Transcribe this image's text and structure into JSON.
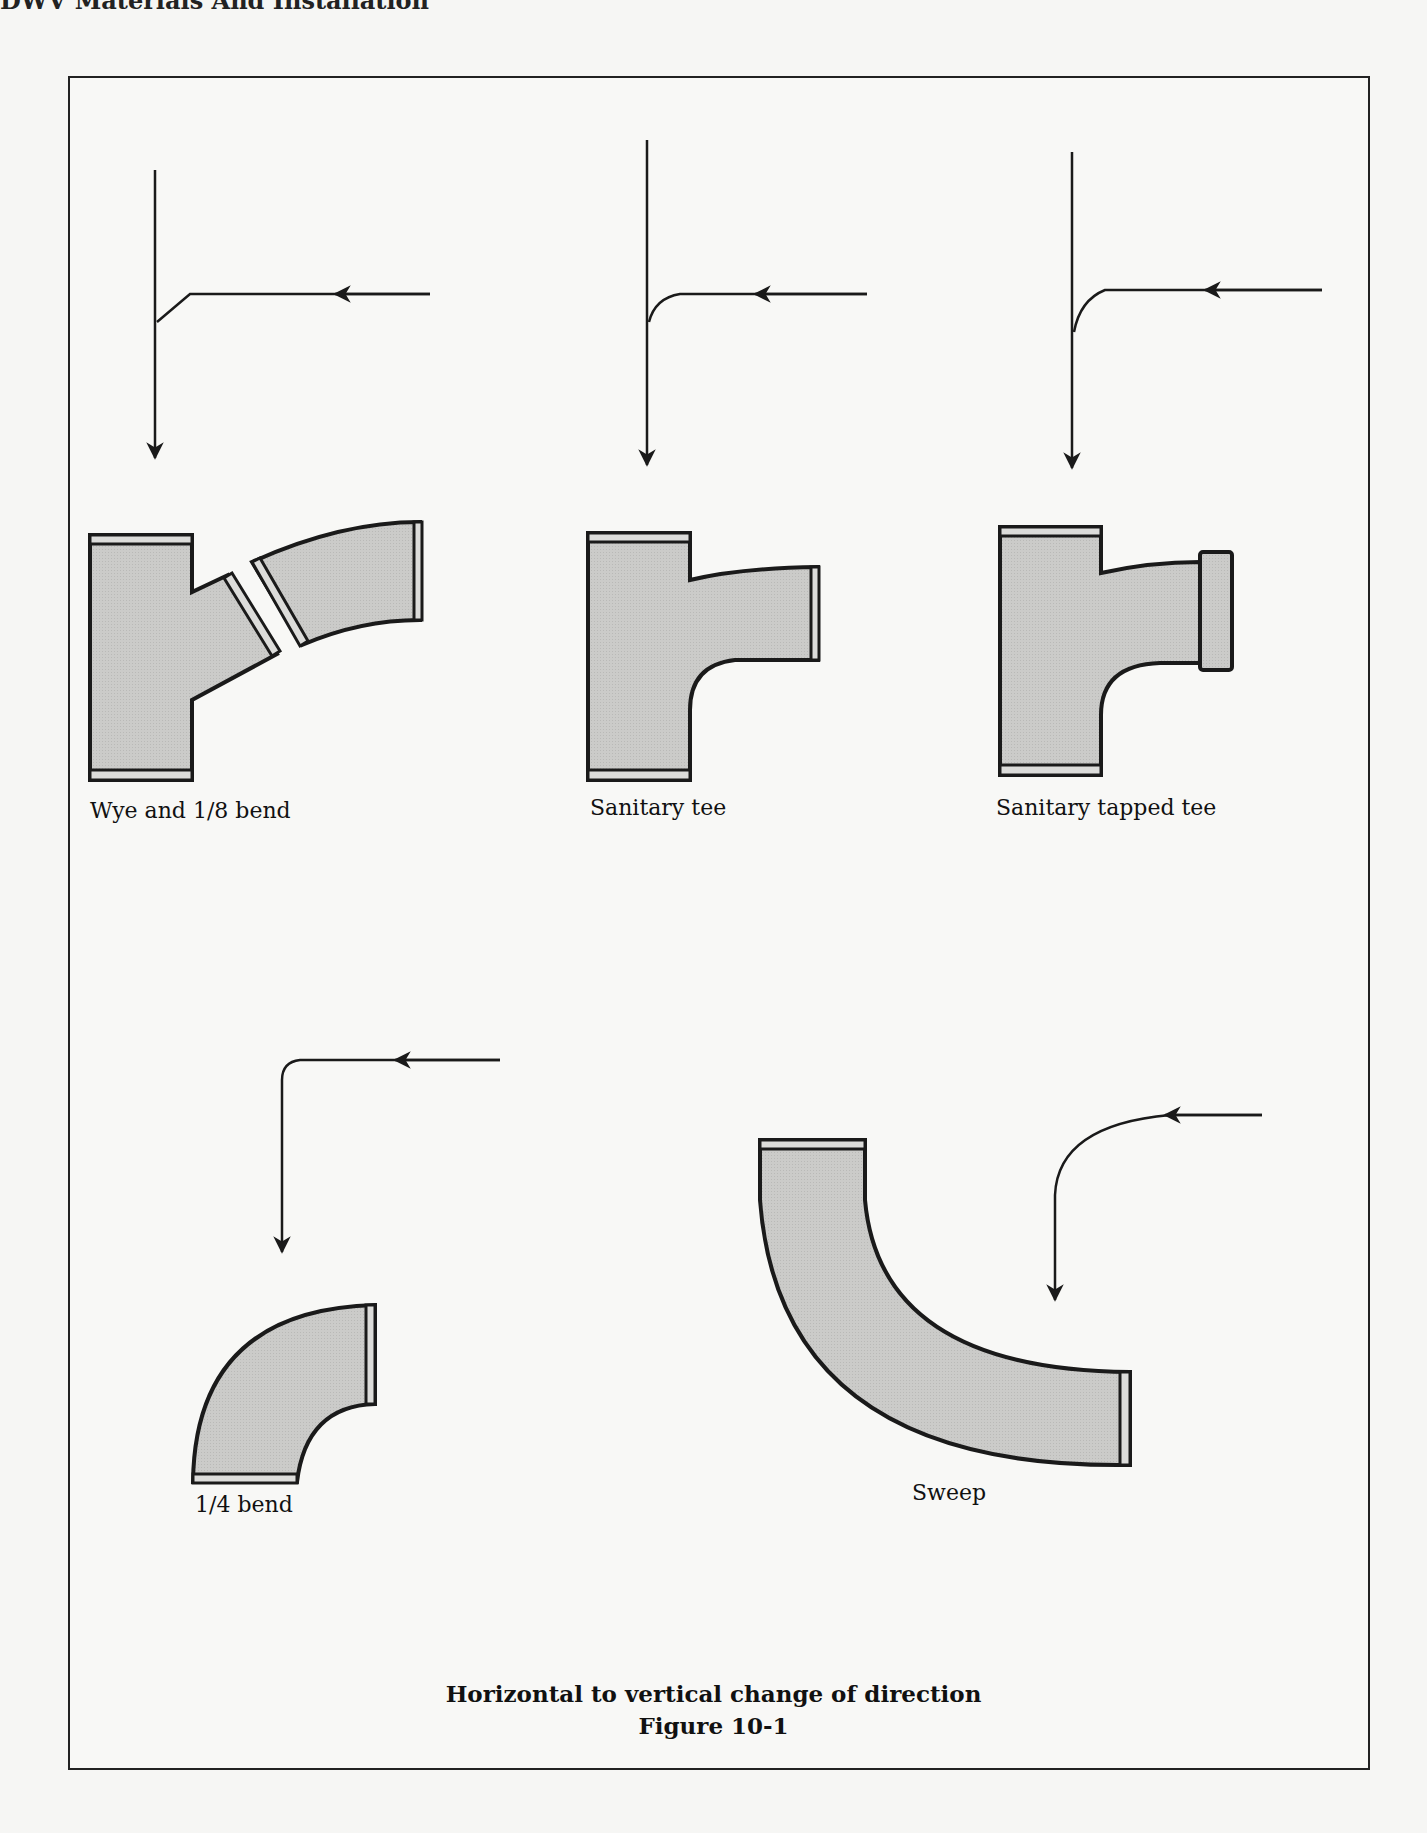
{
  "page": {
    "running_head": "DWV Materials And Installation"
  },
  "figure": {
    "title": "Horizontal to vertical change of direction",
    "number": "Figure 10-1",
    "fittings": [
      {
        "id": "wye",
        "label": "Wye and 1/8 bend"
      },
      {
        "id": "sanitary-tee",
        "label": "Sanitary tee"
      },
      {
        "id": "sanitary-tapped-tee",
        "label": "Sanitary tapped tee"
      },
      {
        "id": "quarter-bend",
        "label": "1/4 bend"
      },
      {
        "id": "sweep",
        "label": "Sweep"
      }
    ],
    "colors": {
      "fitting_fill": "#c8c8c6",
      "outline": "#1a1a1a",
      "hub_band": "#dcdcda"
    }
  }
}
